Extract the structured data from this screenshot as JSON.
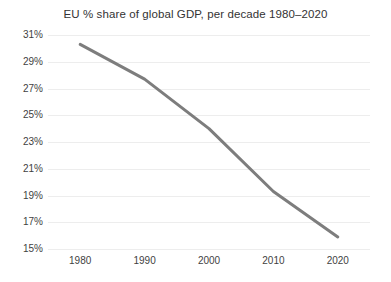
{
  "chart_data": {
    "type": "line",
    "title": "EU % share of global GDP, per decade 1980–2020",
    "xlabel": "",
    "ylabel": "",
    "x": [
      1980,
      1990,
      2000,
      2010,
      2020
    ],
    "categories": [
      "1980",
      "1990",
      "2000",
      "2010",
      "2020"
    ],
    "values": [
      30.3,
      27.7,
      24.0,
      19.3,
      15.9
    ],
    "series": [
      {
        "name": "EU % share of global GDP",
        "values": [
          30.3,
          27.7,
          24.0,
          19.3,
          15.9
        ]
      }
    ],
    "xlim": [
      1975,
      2025
    ],
    "ylim": [
      15,
      31
    ],
    "ytick_labels": [
      "31%",
      "29%",
      "27%",
      "25%",
      "23%",
      "21%",
      "19%",
      "17%",
      "15%"
    ],
    "ytick_values": [
      31,
      29,
      27,
      25,
      23,
      21,
      19,
      17,
      15
    ],
    "xtick_labels": [
      "1980",
      "1990",
      "2000",
      "2010",
      "2020"
    ],
    "xtick_values": [
      1980,
      1990,
      2000,
      2010,
      2020
    ],
    "grid": true,
    "grid_axis": "y",
    "legend": false,
    "legend_position": "none",
    "line_color": "#7d7d7d",
    "grid_color": "#ededed",
    "background_color": "#ffffff",
    "text_color": "#3f3f3f",
    "line_width": 3
  }
}
